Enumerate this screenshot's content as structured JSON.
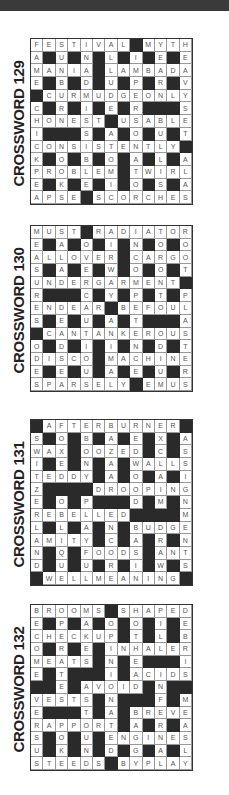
{
  "puzzles": [
    {
      "title": "CROSSWORD 129",
      "rows": [
        "FESTIVAL#MYTH",
        "A#U#N#L#I#E#E",
        "MANIA#LAMBADA",
        "E#B#D#U#P#R#V",
        "#CURMUDGEONLY",
        "C#R#I#E#R###S",
        "HONEST#USABLE",
        "I###S#A#O#U#T",
        "CONSISTENTLY#",
        "K#O#B#O#A#L#A",
        "PROBLEM#TWIRL",
        "E#K#E#I#O#S#A",
        "APSE#SCORCHES"
      ]
    },
    {
      "title": "CROSSWORD 130",
      "rows": [
        "MUST#RADIATOR",
        "E#A#O#I#N#O#O",
        "ALLOVER#CARGO",
        "S#A#E#W#O#O#T",
        "UNDERGARMENT#",
        "R###C#Y#P#T#P",
        "ENDEAR#BEFOUL",
        "S#E#U#A#T###A",
        "#CANTANKEROUS",
        "O#D#I#I#N#D#T",
        "DISCO#MACHINE",
        "E#E#U#A#E#U#R",
        "SPARSELY#EMUS"
      ]
    },
    {
      "title": "CROSSWORD 131",
      "rows": [
        "#AFTERBURNER#",
        "S#O#B#A#E#X#A",
        "WAX#OOZED#C#S",
        "I#E#N#A#WALLS",
        "TEDDY#A#O#A#I",
        "Z####DROOPING",
        "E#O#P###D#M#N",
        "REBELLED####M",
        "L#L#A#N#BUDGE",
        "AMITY#C#A#R#N",
        "N#Q#FOODS#ANT",
        "D#U#U#R#I#W#S",
        "#WELLMEANING#"
      ]
    },
    {
      "title": "CROSSWORD 132",
      "rows": [
        "BROOMS#SHAPED",
        "E#P#A#O#O#I#E",
        "CHECKUP#T#L#B",
        "O#R#E#INHALER",
        "MEATS#N#E###I",
        "E#T###I#ACIDS",
        "##E#AVOID#N##",
        "VESTS#N###F#M",
        "E###T#A#BREVE",
        "RAPPORT#A#R#A",
        "S#O#U#ENGINES",
        "U#K#N#D#G#A#L",
        "STEEDS#BYPLAY"
      ]
    }
  ]
}
